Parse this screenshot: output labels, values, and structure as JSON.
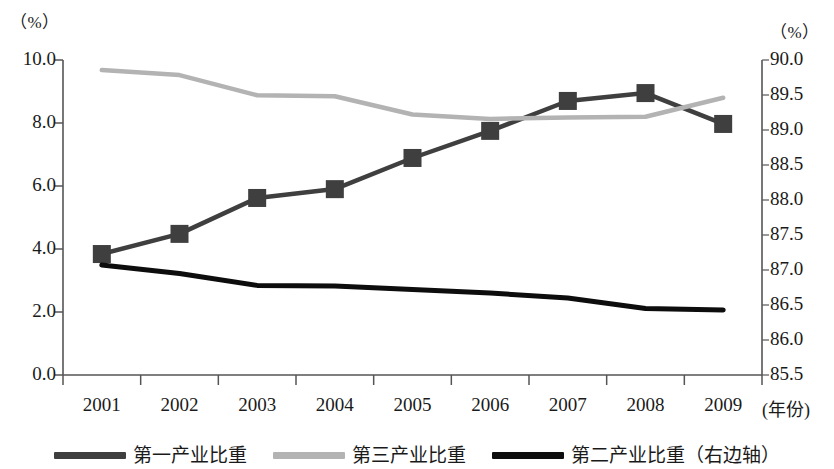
{
  "chart_data": {
    "type": "line",
    "title": "",
    "xlabel": "(年份)",
    "ylabel": "（%）",
    "y2label": "（%）",
    "categories": [
      "2001",
      "2002",
      "2003",
      "2004",
      "2005",
      "2006",
      "2007",
      "2008",
      "2009"
    ],
    "x": [
      2001,
      2002,
      2003,
      2004,
      2005,
      2006,
      2007,
      2008,
      2009
    ],
    "ylim": [
      0.0,
      10.0
    ],
    "yticks": [
      "0.0",
      "2.0",
      "4.0",
      "6.0",
      "8.0",
      "10.0"
    ],
    "ytick_values": [
      0.0,
      2.0,
      4.0,
      6.0,
      8.0,
      10.0
    ],
    "y2lim": [
      85.5,
      90.0
    ],
    "y2ticks": [
      "85.5",
      "86.0",
      "86.5",
      "87.0",
      "87.5",
      "88.0",
      "88.5",
      "89.0",
      "89.5",
      "90.0"
    ],
    "y2tick_values": [
      85.5,
      86.0,
      86.5,
      87.0,
      87.5,
      88.0,
      88.5,
      89.0,
      89.5,
      90.0
    ],
    "grid": false,
    "legend_position": "bottom",
    "series": [
      {
        "name": "第一产业比重",
        "axis": "left",
        "color": "#3f3f3f",
        "marker": "square",
        "values": [
          3.84,
          4.48,
          5.62,
          5.9,
          6.89,
          7.75,
          8.7,
          8.95,
          7.97
        ]
      },
      {
        "name": "第三产业比重",
        "axis": "left",
        "color": "#b3b3b3",
        "marker": "none",
        "values": [
          9.68,
          9.52,
          8.88,
          8.85,
          8.27,
          8.13,
          8.17,
          8.2,
          8.8
        ]
      },
      {
        "name": "第二产业比重（右边轴）",
        "axis": "right",
        "color": "#0d0d0d",
        "marker": "none",
        "values": [
          87.07,
          86.95,
          86.78,
          86.77,
          86.72,
          86.67,
          86.6,
          86.45,
          86.43
        ]
      }
    ]
  },
  "legend": {
    "items": [
      {
        "label": "第一产业比重",
        "color": "#3f3f3f"
      },
      {
        "label": "第三产业比重",
        "color": "#b3b3b3"
      },
      {
        "label": "第二产业比重（右边轴）",
        "color": "#0d0d0d"
      }
    ]
  },
  "axes": {
    "left_unit": "（%）",
    "right_unit": "（%）",
    "x_title": "(年份)"
  }
}
